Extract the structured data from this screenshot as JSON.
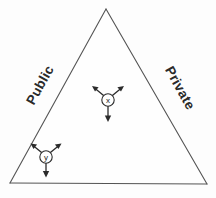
{
  "diagram": {
    "background_color": "#fdfdfd",
    "line_color": "#545454",
    "ink_color": "#2b2b2b",
    "triangle": {
      "apex": {
        "x": 106,
        "y": 9
      },
      "bottom_left": {
        "x": 10,
        "y": 183
      },
      "bottom_right": {
        "x": 207,
        "y": 184
      }
    },
    "edge_labels": [
      {
        "id": "left-edge-label",
        "text": "Public",
        "rotation_deg": -61,
        "x": 40,
        "y": 85
      },
      {
        "id": "right-edge-label",
        "text": "Private",
        "rotation_deg": 61,
        "x": 180,
        "y": 88
      }
    ],
    "nodes": [
      {
        "id": "node-x",
        "label": "x",
        "cx": 108,
        "cy": 100,
        "r": 6.2,
        "arrows": [
          {
            "direction": "up-left",
            "angle_deg": 210,
            "length": 16
          },
          {
            "direction": "up-right",
            "angle_deg": 330,
            "length": 16
          },
          {
            "direction": "down",
            "angle_deg": 90,
            "length": 16
          }
        ]
      },
      {
        "id": "node-y",
        "label": "y",
        "cx": 46,
        "cy": 157,
        "r": 6.2,
        "arrows": [
          {
            "direction": "up-left",
            "angle_deg": 210,
            "length": 15
          },
          {
            "direction": "up-right",
            "angle_deg": 330,
            "length": 15
          },
          {
            "direction": "down",
            "angle_deg": 90,
            "length": 15
          }
        ]
      }
    ],
    "caption": ""
  }
}
